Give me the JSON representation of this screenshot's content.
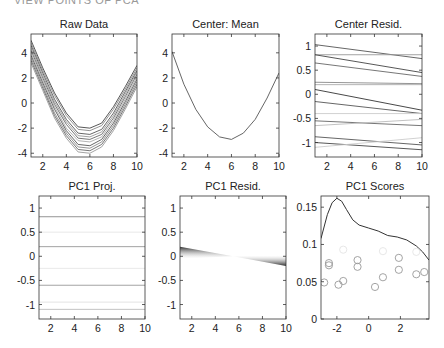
{
  "header": {
    "title": "VIEW POINTS OF PCA",
    "right_fragment": "..."
  },
  "chart_data": [
    {
      "type": "line",
      "title": "Raw Data",
      "xlabel": "",
      "ylabel": "",
      "xlim": [
        1,
        10
      ],
      "ylim": [
        -4.3,
        5.5
      ],
      "xticks": [
        2,
        4,
        6,
        8,
        10
      ],
      "yticks": [
        -4,
        -2,
        0,
        2,
        4
      ],
      "grid": false,
      "x": [
        1,
        2,
        3,
        4,
        5,
        6,
        7,
        8,
        9,
        10
      ],
      "series": [
        {
          "name": "obs1",
          "values": [
            5.0,
            2.8,
            0.8,
            -0.8,
            -1.9,
            -2.0,
            -1.6,
            -0.3,
            1.3,
            3.0
          ]
        },
        {
          "name": "obs2",
          "values": [
            4.8,
            2.6,
            0.6,
            -1.0,
            -2.1,
            -2.2,
            -1.8,
            -0.5,
            1.1,
            2.8
          ]
        },
        {
          "name": "obs3",
          "values": [
            4.6,
            2.4,
            0.3,
            -1.3,
            -2.4,
            -2.5,
            -2.1,
            -0.8,
            0.9,
            2.6
          ]
        },
        {
          "name": "obs4",
          "values": [
            4.4,
            2.2,
            0.1,
            -1.5,
            -2.6,
            -2.7,
            -2.3,
            -1.0,
            0.7,
            2.5
          ]
        },
        {
          "name": "obs5",
          "values": [
            4.2,
            2.0,
            -0.1,
            -1.7,
            -2.8,
            -2.9,
            -2.5,
            -1.2,
            0.5,
            2.3
          ]
        },
        {
          "name": "obs6",
          "values": [
            4.0,
            1.8,
            -0.3,
            -2.0,
            -3.0,
            -3.1,
            -2.7,
            -1.4,
            0.3,
            2.1
          ]
        },
        {
          "name": "obs7",
          "values": [
            3.8,
            1.6,
            -0.5,
            -2.2,
            -3.3,
            -3.4,
            -2.9,
            -1.6,
            0.1,
            1.9
          ]
        },
        {
          "name": "obs8",
          "values": [
            3.6,
            1.4,
            -0.8,
            -2.4,
            -3.5,
            -3.6,
            -3.1,
            -1.8,
            -0.1,
            1.7
          ]
        },
        {
          "name": "obs9",
          "values": [
            3.4,
            1.2,
            -1.0,
            -2.6,
            -3.7,
            -3.8,
            -3.3,
            -2.0,
            -0.3,
            1.5
          ]
        },
        {
          "name": "obs10",
          "values": [
            3.2,
            1.0,
            -1.2,
            -2.8,
            -3.9,
            -4.0,
            -3.5,
            -2.2,
            -0.5,
            1.3
          ]
        }
      ]
    },
    {
      "type": "line",
      "title": "Center: Mean",
      "xlabel": "",
      "ylabel": "",
      "xlim": [
        1,
        10
      ],
      "ylim": [
        -4.3,
        5.5
      ],
      "xticks": [
        2,
        4,
        6,
        8,
        10
      ],
      "yticks": [
        -4,
        -2,
        0,
        2,
        4
      ],
      "grid": false,
      "x": [
        1,
        2,
        3,
        4,
        5,
        6,
        7,
        8,
        9,
        10
      ],
      "series": [
        {
          "name": "mean",
          "values": [
            4.1,
            1.5,
            -0.5,
            -1.9,
            -2.7,
            -2.9,
            -2.4,
            -1.3,
            0.4,
            2.4
          ]
        }
      ]
    },
    {
      "type": "line",
      "title": "Center Resid.",
      "xlabel": "",
      "ylabel": "",
      "xlim": [
        1,
        10
      ],
      "ylim": [
        -1.3,
        1.25
      ],
      "xticks": [
        2,
        4,
        6,
        8,
        10
      ],
      "yticks": [
        -1,
        -0.5,
        0,
        0.5,
        1
      ],
      "grid": false,
      "x": [
        1,
        10
      ],
      "series": [
        {
          "name": "r1",
          "values": [
            1.03,
            0.74
          ],
          "shade": "#555"
        },
        {
          "name": "r2",
          "values": [
            0.82,
            0.82
          ],
          "shade": "#999"
        },
        {
          "name": "r3",
          "values": [
            0.82,
            0.45
          ],
          "shade": "#444"
        },
        {
          "name": "r4",
          "values": [
            0.65,
            0.37
          ],
          "shade": "#666"
        },
        {
          "name": "r5",
          "values": [
            0.25,
            0.22
          ],
          "shade": "#888"
        },
        {
          "name": "r6",
          "values": [
            0.2,
            0.2
          ],
          "shade": "#aaa"
        },
        {
          "name": "r7",
          "values": [
            0.1,
            -0.33
          ],
          "shade": "#333"
        },
        {
          "name": "r8",
          "values": [
            -0.15,
            -0.4
          ],
          "shade": "#555"
        },
        {
          "name": "r9",
          "values": [
            -0.4,
            -0.4
          ],
          "shade": "#ccc"
        },
        {
          "name": "r10",
          "values": [
            -0.55,
            -0.65
          ],
          "shade": "#666"
        },
        {
          "name": "r11",
          "values": [
            -0.65,
            -0.52
          ],
          "shade": "#bbb"
        },
        {
          "name": "r12",
          "values": [
            -0.88,
            -1.05
          ],
          "shade": "#555"
        },
        {
          "name": "r13",
          "values": [
            -1.0,
            -1.15
          ],
          "shade": "#444"
        },
        {
          "name": "r14",
          "values": [
            -1.1,
            -0.9
          ],
          "shade": "#ccc"
        }
      ]
    },
    {
      "type": "line",
      "title": "PC1 Proj.",
      "xlabel": "",
      "ylabel": "",
      "xlim": [
        1,
        10
      ],
      "ylim": [
        -1.3,
        1.25
      ],
      "xticks": [
        2,
        4,
        6,
        8,
        10
      ],
      "yticks": [
        -1,
        -0.5,
        0,
        0.5,
        1
      ],
      "grid": false,
      "x": [
        1,
        10
      ],
      "series": [
        {
          "name": "p1",
          "values": [
            0.82,
            0.82
          ],
          "shade": "#888"
        },
        {
          "name": "p2",
          "values": [
            0.5,
            0.5
          ],
          "shade": "#e6e6e6"
        },
        {
          "name": "p3",
          "values": [
            0.2,
            0.2
          ],
          "shade": "#999"
        },
        {
          "name": "p4",
          "values": [
            -0.25,
            -0.25
          ],
          "shade": "#e6e6e6"
        },
        {
          "name": "p5",
          "values": [
            -0.6,
            -0.6
          ],
          "shade": "#999"
        },
        {
          "name": "p6",
          "values": [
            -0.95,
            -0.95
          ],
          "shade": "#e0e0e0"
        },
        {
          "name": "p7",
          "values": [
            -1.1,
            -1.1
          ],
          "shade": "#bbb"
        }
      ]
    },
    {
      "type": "area",
      "title": "PC1 Resid.",
      "xlabel": "",
      "ylabel": "",
      "xlim": [
        1,
        10
      ],
      "ylim": [
        -1.3,
        1.25
      ],
      "xticks": [
        2,
        4,
        6,
        8,
        10
      ],
      "yticks": [
        -1,
        -0.5,
        0,
        0.5,
        1
      ],
      "grid": false,
      "x": [
        1,
        5.5,
        10
      ],
      "series": [
        {
          "name": "upper_envelope",
          "values": [
            0.2,
            0.0,
            0.02
          ]
        },
        {
          "name": "lower_envelope",
          "values": [
            -0.05,
            0.0,
            -0.2
          ]
        }
      ]
    },
    {
      "type": "scatter",
      "title": "PC1 Scores",
      "xlabel": "",
      "ylabel": "",
      "xlim": [
        -3,
        3.8
      ],
      "ylim": [
        0,
        0.165
      ],
      "xticks": [
        -2,
        0,
        2
      ],
      "yticks": [
        0,
        0.05,
        0.1,
        0.15
      ],
      "grid": false,
      "series": [
        {
          "name": "density",
          "type": "line",
          "x": [
            -3,
            -2.6,
            -2.3,
            -2.0,
            -1.7,
            -1.4,
            -1.0,
            -0.6,
            0,
            0.6,
            1.2,
            1.8,
            2.4,
            3.0,
            3.4,
            3.8
          ],
          "y": [
            0.108,
            0.14,
            0.156,
            0.162,
            0.158,
            0.147,
            0.133,
            0.126,
            0.122,
            0.118,
            0.112,
            0.11,
            0.106,
            0.098,
            0.09,
            0.079
          ]
        },
        {
          "name": "scores_dark",
          "type": "scatter",
          "x": [
            -2.8,
            -2.5,
            -2.5,
            -1.9,
            -1.6,
            -0.7,
            -0.7,
            0.4,
            0.9,
            1.9,
            1.9,
            3.0,
            3.5
          ],
          "y": [
            0.049,
            0.075,
            0.072,
            0.046,
            0.051,
            0.079,
            0.07,
            0.043,
            0.056,
            0.066,
            0.082,
            0.06,
            0.063
          ]
        },
        {
          "name": "scores_faint",
          "type": "scatter",
          "x": [
            -1.6,
            0.9,
            3.0
          ],
          "y": [
            0.093,
            0.091,
            0.09
          ]
        }
      ]
    }
  ]
}
